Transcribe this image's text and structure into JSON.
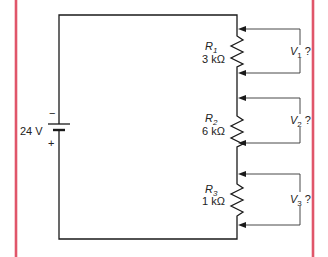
{
  "diagram": {
    "type": "series-circuit",
    "source": {
      "label": "24 V",
      "neg_sign": "−",
      "pos_sign": "+"
    },
    "resistors": [
      {
        "name": "R",
        "sub": "1",
        "value": "3 kΩ",
        "meter": {
          "name": "V",
          "sub": "1",
          "suffix": "?"
        }
      },
      {
        "name": "R",
        "sub": "2",
        "value": "6 kΩ",
        "meter": {
          "name": "V",
          "sub": "2",
          "suffix": "?"
        }
      },
      {
        "name": "R",
        "sub": "3",
        "value": "1 kΩ",
        "meter": {
          "name": "V",
          "sub": "3",
          "suffix": "?"
        }
      }
    ],
    "colors": {
      "frame": "#e0566a",
      "wire": "#1a1a1a"
    }
  }
}
